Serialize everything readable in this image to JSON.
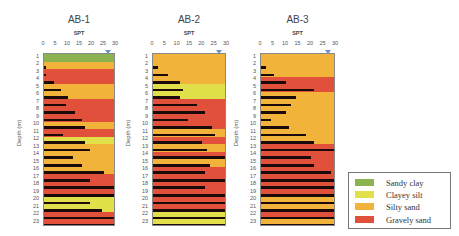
{
  "chart_data": [
    {
      "type": "bar",
      "title": "AB-1",
      "xlabel": "SPT",
      "ylabel": "Depth (m)",
      "xlim": [
        0,
        30
      ],
      "x_ticks": [
        "0",
        "5",
        "10",
        "15",
        "20",
        "25",
        "30"
      ],
      "categories": [
        "1",
        "2",
        "3",
        "4",
        "5",
        "6",
        "7",
        "8",
        "9",
        "10",
        "11",
        "12",
        "13",
        "14",
        "15",
        "16",
        "17",
        "18",
        "19",
        "20",
        "21",
        "22",
        "23"
      ],
      "values": [
        0,
        1,
        1,
        4,
        7,
        10,
        9,
        13,
        16,
        17,
        8,
        17,
        19,
        12,
        16,
        25,
        19,
        30,
        30,
        19,
        24,
        30,
        30
      ],
      "soil": [
        "sandy_clay",
        "silty_sand",
        "gravely_sand",
        "gravely_sand",
        "silty_sand",
        "silty_sand",
        "gravely_sand",
        "gravely_sand",
        "gravely_sand",
        "silty_sand",
        "gravely_sand",
        "clayey_silt",
        "silty_sand",
        "silty_sand",
        "silty_sand",
        "silty_sand",
        "gravely_sand",
        "gravely_sand",
        "gravely_sand",
        "clayey_silt",
        "clayey_silt",
        "gravely_sand",
        "gravely_sand"
      ],
      "water_level_marker_x": 27
    },
    {
      "type": "bar",
      "title": "AB-2",
      "xlabel": "SPT",
      "ylabel": "Depth (m)",
      "xlim": [
        0,
        30
      ],
      "x_ticks": [
        "0",
        "5",
        "10",
        "15",
        "20",
        "25",
        "30"
      ],
      "categories": [
        "1",
        "2",
        "3",
        "4",
        "5",
        "6",
        "7",
        "8",
        "9",
        "10",
        "11",
        "12",
        "13",
        "14",
        "15",
        "16",
        "17",
        "18",
        "19",
        "20",
        "21",
        "22",
        "23"
      ],
      "values": [
        0,
        2,
        6,
        11,
        12,
        11,
        18,
        21,
        14,
        24,
        25,
        20,
        22,
        30,
        23,
        21,
        30,
        21,
        30,
        30,
        30,
        30,
        30
      ],
      "soil": [
        "silty_sand",
        "silty_sand",
        "silty_sand",
        "silty_sand",
        "clayey_silt",
        "clayey_silt",
        "gravely_sand",
        "gravely_sand",
        "gravely_sand",
        "gravely_sand",
        "silty_sand",
        "gravely_sand",
        "silty_sand",
        "gravely_sand",
        "silty_sand",
        "gravely_sand",
        "gravely_sand",
        "gravely_sand",
        "gravely_sand",
        "gravely_sand",
        "gravely_sand",
        "clayey_silt",
        "clayey_silt"
      ],
      "water_level_marker_x": 27
    },
    {
      "type": "bar",
      "title": "AB-3",
      "xlabel": "SPT",
      "ylabel": "Depth (m)",
      "xlim": [
        0,
        30
      ],
      "x_ticks": [
        "0",
        "5",
        "10",
        "15",
        "20",
        "25",
        "30"
      ],
      "categories": [
        "1",
        "2",
        "3",
        "4",
        "5",
        "6",
        "7",
        "8",
        "9",
        "10",
        "11",
        "12",
        "13",
        "14",
        "15",
        "16",
        "17",
        "18",
        "19",
        "20",
        "21",
        "22",
        "23"
      ],
      "values": [
        0,
        2,
        5,
        10,
        21,
        14,
        12,
        10,
        4,
        11,
        18,
        21,
        30,
        20,
        21,
        28,
        30,
        30,
        30,
        30,
        30,
        30,
        30
      ],
      "soil": [
        "silty_sand",
        "silty_sand",
        "silty_sand",
        "gravely_sand",
        "gravely_sand",
        "silty_sand",
        "silty_sand",
        "silty_sand",
        "silty_sand",
        "silty_sand",
        "silty_sand",
        "silty_sand",
        "gravely_sand",
        "gravely_sand",
        "gravely_sand",
        "gravely_sand",
        "gravely_sand",
        "gravely_sand",
        "gravely_sand",
        "silty_sand",
        "silty_sand",
        "gravely_sand",
        "silty_sand"
      ],
      "water_level_marker_x": 27
    }
  ],
  "colors": {
    "sandy_clay": "#8bb34f",
    "clayey_silt": "#e2e04a",
    "silty_sand": "#f2b33a",
    "gravely_sand": "#e0503a",
    "spt_bar": "#1a0a0a",
    "water_marker": "#6b8fc9"
  },
  "legend": [
    {
      "key": "sandy_clay",
      "label": "Sandy clay"
    },
    {
      "key": "clayey_silt",
      "label": "Clayey silt"
    },
    {
      "key": "silty_sand",
      "label": "Silty sand"
    },
    {
      "key": "gravely_sand",
      "label": "Gravely sand"
    }
  ],
  "labels": {
    "panel_titles": [
      "AB-1",
      "AB-2",
      "AB-3"
    ],
    "spt": "SPT",
    "depth": "Depth (m)"
  }
}
